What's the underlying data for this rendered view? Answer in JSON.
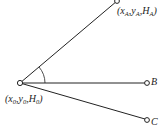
{
  "diagram": {
    "points": {
      "O": {
        "label_x": "x",
        "label_x_sub": "0",
        "label_y": "y",
        "label_y_sub": "0",
        "label_h": "H",
        "label_h_sub": "0"
      },
      "A": {
        "label_x": "x",
        "label_x_sub": "A",
        "label_y": "y",
        "label_y_sub": "A",
        "label_h": "H",
        "label_h_sub": "A"
      },
      "B": {
        "label": "B"
      },
      "C": {
        "label": "C"
      }
    },
    "punct": {
      "open": "(",
      "comma": ",",
      "close": ")"
    },
    "colors": {
      "line": "#222222",
      "background": "#ffffff"
    }
  }
}
